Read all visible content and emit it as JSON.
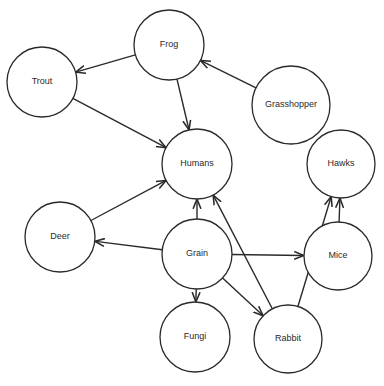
{
  "diagram": {
    "type": "food-web",
    "colors": {
      "stroke": "#2a2a2a",
      "background": "#ffffff",
      "text": "#2a2a2a"
    },
    "nodes": [
      {
        "id": "frog",
        "label": "Frog",
        "cx": 169,
        "cy": 45,
        "r": 35
      },
      {
        "id": "trout",
        "label": "Trout",
        "cx": 42,
        "cy": 82,
        "r": 35
      },
      {
        "id": "grasshopper",
        "label": "Grasshopper",
        "cx": 291,
        "cy": 105,
        "r": 39
      },
      {
        "id": "humans",
        "label": "Humans",
        "cx": 197,
        "cy": 164,
        "r": 35
      },
      {
        "id": "hawks",
        "label": "Hawks",
        "cx": 341,
        "cy": 164,
        "r": 34
      },
      {
        "id": "deer",
        "label": "Deer",
        "cx": 60,
        "cy": 237,
        "r": 35
      },
      {
        "id": "grain",
        "label": "Grain",
        "cx": 197,
        "cy": 254,
        "r": 35
      },
      {
        "id": "mice",
        "label": "Mice",
        "cx": 338,
        "cy": 256,
        "r": 34
      },
      {
        "id": "fungi",
        "label": "Fungi",
        "cx": 195,
        "cy": 337,
        "r": 35
      },
      {
        "id": "rabbit",
        "label": "Rabbit",
        "cx": 288,
        "cy": 339,
        "r": 34
      }
    ],
    "edges": [
      {
        "from": "frog",
        "to": "trout"
      },
      {
        "from": "grasshopper",
        "to": "frog"
      },
      {
        "from": "frog",
        "to": "humans"
      },
      {
        "from": "trout",
        "to": "humans"
      },
      {
        "from": "deer",
        "to": "humans"
      },
      {
        "from": "grain",
        "to": "humans"
      },
      {
        "from": "rabbit",
        "to": "humans"
      },
      {
        "from": "grain",
        "to": "deer"
      },
      {
        "from": "grain",
        "to": "mice"
      },
      {
        "from": "grain",
        "to": "fungi"
      },
      {
        "from": "grain",
        "to": "rabbit"
      },
      {
        "from": "mice",
        "to": "hawks"
      },
      {
        "from": "rabbit",
        "to": "hawks"
      }
    ]
  }
}
